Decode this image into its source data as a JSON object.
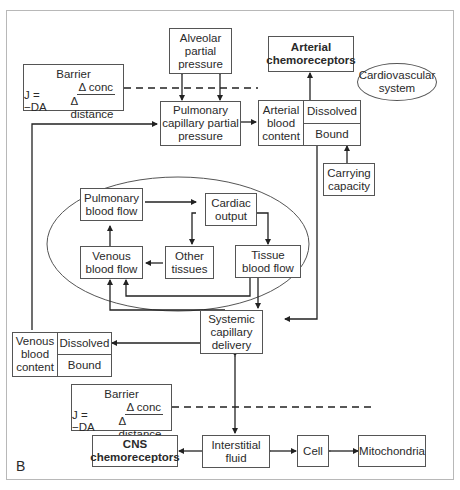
{
  "panel_label": "B",
  "system_label": "Cardiovascular system",
  "nodes": {
    "alveolar": "Alveolar partial pressure",
    "arterial_chemo": "Arterial chemoreceptors",
    "pulmonary_capillary": "Pulmonary capillary partial pressure",
    "arterial_content": {
      "label": "Arterial blood content",
      "top": "Dissolved",
      "bottom": "Bound"
    },
    "carrying_capacity": "Carrying capacity",
    "pulmonary_blood_flow": "Pulmonary blood flow",
    "cardiac_output": "Cardiac output",
    "venous_blood_flow": "Venous blood flow",
    "other_tissues": "Other tissues",
    "tissue_blood_flow": "Tissue blood flow",
    "systemic_capillary": "Systemic capillary delivery",
    "venous_content": {
      "label": "Venous blood content",
      "top": "Dissolved",
      "bottom": "Bound"
    },
    "cns_chemo": "CNS chemoreceptors",
    "interstitial": "Interstitial fluid",
    "cell": "Cell",
    "mitochondria": "Mitochondria"
  },
  "barriers": [
    {
      "title": "Barrier",
      "lhs": "J = −DA",
      "numerator": "Δ conc",
      "denominator": "Δ distance"
    },
    {
      "title": "Barrier",
      "lhs": "J = −DA",
      "numerator": "Δ conc",
      "denominator": "Δ distance"
    }
  ],
  "colors": {
    "line": "#333333",
    "box_border": "#555555",
    "frame": "#b8b8b8"
  }
}
